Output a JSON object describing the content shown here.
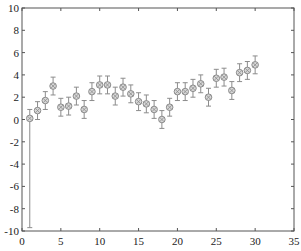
{
  "chart_data": {
    "type": "scatter",
    "title": "",
    "xlabel": "",
    "ylabel": "",
    "xlim": [
      0,
      35
    ],
    "ylim": [
      -10,
      10
    ],
    "xticks": [
      0,
      5,
      10,
      15,
      20,
      25,
      30,
      35
    ],
    "yticks": [
      -10,
      -8,
      -6,
      -4,
      -2,
      0,
      2,
      4,
      6,
      8,
      10
    ],
    "grid": false,
    "legend": null,
    "marker": "circle-with-cross",
    "color": "#8c8c8c",
    "series": [
      {
        "name": "data",
        "x": [
          1,
          2,
          3,
          4,
          5,
          6,
          7,
          8,
          9,
          10,
          11,
          12,
          13,
          14,
          15,
          16,
          17,
          18,
          19,
          20,
          21,
          22,
          23,
          24,
          25,
          26,
          27,
          28,
          29,
          30
        ],
        "y": [
          0.1,
          0.8,
          1.7,
          3.0,
          1.1,
          1.2,
          2.1,
          0.9,
          2.5,
          3.1,
          3.1,
          2.1,
          2.9,
          2.3,
          1.6,
          1.4,
          0.9,
          0.0,
          1.1,
          2.5,
          2.5,
          2.8,
          3.2,
          2.0,
          3.7,
          3.8,
          2.6,
          4.2,
          4.4,
          4.9
        ],
        "err_low": [
          9.8,
          0.8,
          0.8,
          0.8,
          0.8,
          0.8,
          0.8,
          0.8,
          0.8,
          0.8,
          0.8,
          0.8,
          0.8,
          0.8,
          0.8,
          0.8,
          0.8,
          0.8,
          0.8,
          0.8,
          0.8,
          0.8,
          0.8,
          0.8,
          0.8,
          0.8,
          0.8,
          0.8,
          0.8,
          0.8
        ],
        "err_high": [
          0.8,
          0.8,
          0.8,
          0.8,
          0.8,
          0.8,
          0.8,
          0.8,
          0.8,
          0.8,
          0.8,
          0.8,
          0.8,
          0.8,
          0.8,
          0.8,
          0.8,
          0.8,
          0.8,
          0.8,
          0.8,
          0.8,
          0.8,
          0.8,
          0.8,
          0.8,
          0.8,
          0.8,
          0.8,
          0.8
        ]
      }
    ]
  }
}
